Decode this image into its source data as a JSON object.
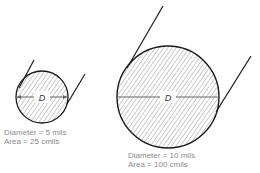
{
  "small_wire": {
    "label": "D",
    "diameter_text": "Diameter = 5 mils",
    "area_text": "Area = 25 cmils"
  },
  "large_wire": {
    "label": "D",
    "diameter_text": "Diameter = 10 mils",
    "area_text": "Area = 100 cmils"
  },
  "colors": {
    "outline": "#1a1a1a",
    "hatch": "#9a9a9a",
    "caption": "#8a8a8a"
  }
}
